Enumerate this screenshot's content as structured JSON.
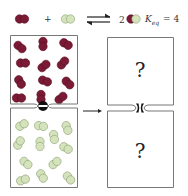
{
  "equation": {
    "reactant_a": "red-dimer",
    "plus": "+",
    "reactant_b": "green-dimer",
    "arrow": "equilibrium-arrows",
    "product_coefficient": "2",
    "product": "red-green-dimer",
    "keq_label": "K",
    "keq_subscript": "eq",
    "keq_value": "= 4"
  },
  "left_container": {
    "top_chamber": {
      "contents": "red-dimer",
      "count": 12
    },
    "valve": "closed",
    "bottom_chamber": {
      "contents": "green-dimer",
      "count": 12
    }
  },
  "transition_arrow": "right-arrow",
  "right_container": {
    "top_chamber": {
      "label": "?"
    },
    "valve": "open",
    "bottom_chamber": {
      "label": "?"
    }
  },
  "colors": {
    "red": "#7a1a35",
    "red_dark": "#5a0f25",
    "green": "#d4e3bc",
    "green_stroke": "#8fa274",
    "box_stroke": "#777777",
    "valve": "#111111"
  }
}
